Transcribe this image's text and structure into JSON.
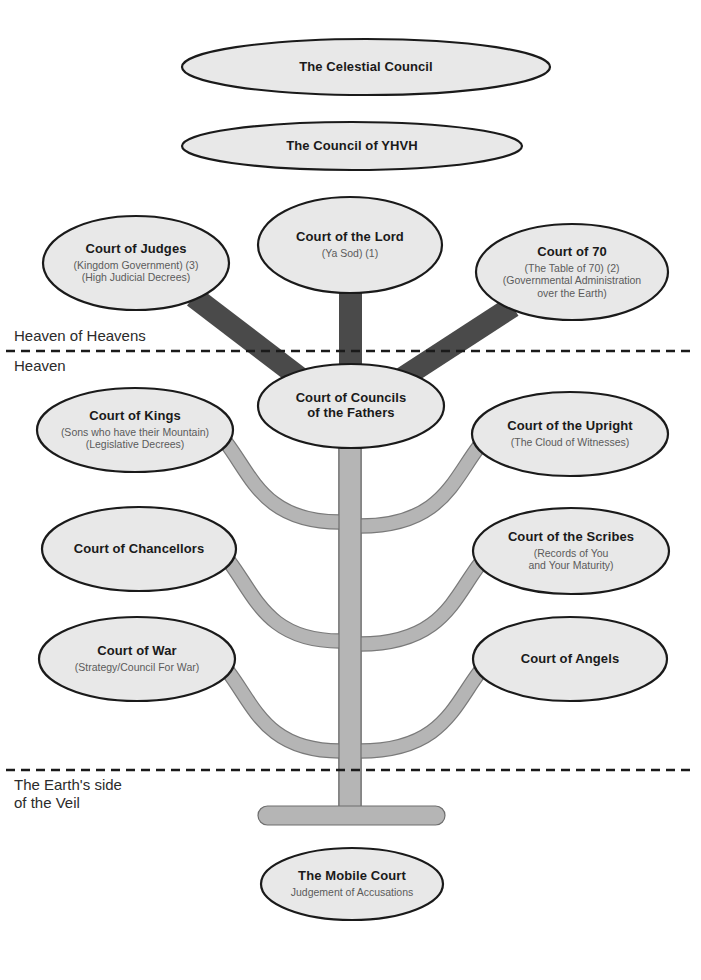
{
  "diagram": {
    "title_fragment": "The Courts",
    "background_color": "#ffffff",
    "node_fill": "#e8e8e8",
    "node_stroke": "#1a1a1a",
    "upper_branch_color": "#4a4a4a",
    "lower_branch_color": "#b5b5b5",
    "divider_color": "#1a1a1a"
  },
  "region_labels": [
    {
      "id": "heaven-of-heavens",
      "text": "Heaven of Heavens",
      "x": 14,
      "y": 327
    },
    {
      "id": "heaven",
      "text": "Heaven",
      "x": 14,
      "y": 357
    },
    {
      "id": "earth-side-of-veil",
      "text": "The Earth's side\nof the Veil",
      "x": 14,
      "y": 776
    }
  ],
  "dividers": [
    {
      "id": "heavens-divider",
      "y": 351
    },
    {
      "id": "veil-divider",
      "y": 770
    }
  ],
  "nodes": [
    {
      "id": "celestial-council",
      "title": "The Celestial Council",
      "sub": [],
      "cx": 366,
      "cy": 67,
      "rx": 184,
      "ry": 28,
      "title_size": 13
    },
    {
      "id": "council-of-yhvh",
      "title": "The Council of YHVH",
      "sub": [],
      "cx": 352,
      "cy": 146,
      "rx": 170,
      "ry": 24,
      "title_size": 13
    },
    {
      "id": "court-of-the-lord",
      "title": "Court of the Lord",
      "sub": [
        "(Ya Sod) (1)"
      ],
      "cx": 350,
      "cy": 245,
      "rx": 92,
      "ry": 48,
      "title_size": 13
    },
    {
      "id": "court-of-judges",
      "title": "Court of Judges",
      "sub": [
        "(Kingdom Government) (3)",
        "(High Judicial Decrees)"
      ],
      "cx": 136,
      "cy": 263,
      "rx": 93,
      "ry": 47,
      "title_size": 13
    },
    {
      "id": "court-of-70",
      "title": "Court of 70",
      "sub": [
        "(The Table of 70) (2)",
        "(Governmental Administration",
        "over the Earth)"
      ],
      "cx": 572,
      "cy": 272,
      "rx": 96,
      "ry": 48,
      "title_size": 13
    },
    {
      "id": "court-of-councils-of-the-fathers",
      "title": "Court of Councils\nof the Fathers",
      "sub": [],
      "cx": 351,
      "cy": 406,
      "rx": 93,
      "ry": 42,
      "title_size": 13
    },
    {
      "id": "court-of-kings",
      "title": "Court of Kings",
      "sub": [
        "(Sons who have their Mountain)",
        "(Legislative Decrees)"
      ],
      "cx": 135,
      "cy": 430,
      "rx": 98,
      "ry": 42,
      "title_size": 13
    },
    {
      "id": "court-of-the-upright",
      "title": "Court of the Upright",
      "sub": [
        "(The Cloud of Witnesses)"
      ],
      "cx": 570,
      "cy": 434,
      "rx": 98,
      "ry": 42,
      "title_size": 13
    },
    {
      "id": "court-of-chancellors",
      "title": "Court of Chancellors",
      "sub": [],
      "cx": 139,
      "cy": 549,
      "rx": 97,
      "ry": 42,
      "title_size": 13
    },
    {
      "id": "court-of-the-scribes",
      "title": "Court of the Scribes",
      "sub": [
        "(Records of You",
        "and Your Maturity)"
      ],
      "cx": 571,
      "cy": 551,
      "rx": 98,
      "ry": 43,
      "title_size": 13
    },
    {
      "id": "court-of-war",
      "title": "Court of War",
      "sub": [
        "(Strategy/Council For War)"
      ],
      "cx": 137,
      "cy": 659,
      "rx": 98,
      "ry": 42,
      "title_size": 13
    },
    {
      "id": "court-of-angels",
      "title": "Court of Angels",
      "sub": [],
      "cx": 570,
      "cy": 659,
      "rx": 97,
      "ry": 42,
      "title_size": 13
    },
    {
      "id": "the-mobile-court",
      "title": "The Mobile Court",
      "sub": [
        "Judgement of Accusations"
      ],
      "cx": 352,
      "cy": 884,
      "rx": 91,
      "ry": 36,
      "title_size": 13
    }
  ],
  "connectors": {
    "upper_trunk": {
      "id": "upper-trunk",
      "x": 339,
      "y": 243,
      "w": 23,
      "h": 163
    },
    "upper_left_branch": {
      "id": "upper-left-branch",
      "from": "court-of-judges",
      "to": "court-of-councils-of-the-fathers"
    },
    "upper_right_branch": {
      "id": "upper-right-branch",
      "from": "court-of-70",
      "to": "court-of-councils-of-the-fathers"
    },
    "lower_trunk": {
      "id": "lower-trunk",
      "x": 339,
      "y": 404,
      "w": 22,
      "h": 410
    },
    "curved_branches": [
      {
        "id": "branch-kings",
        "side": "left",
        "node": "court-of-kings"
      },
      {
        "id": "branch-upright",
        "side": "right",
        "node": "court-of-the-upright"
      },
      {
        "id": "branch-chancellors",
        "side": "left",
        "node": "court-of-chancellors"
      },
      {
        "id": "branch-scribes",
        "side": "right",
        "node": "court-of-the-scribes"
      },
      {
        "id": "branch-war",
        "side": "left",
        "node": "court-of-war"
      },
      {
        "id": "branch-angels",
        "side": "right",
        "node": "court-of-angels"
      }
    ],
    "base_bar": {
      "id": "trunk-base-bar",
      "x": 258,
      "y": 806,
      "w": 187,
      "h": 19
    }
  }
}
